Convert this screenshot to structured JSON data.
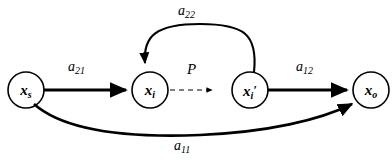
{
  "diagram": {
    "type": "signal-flow-graph",
    "background_color": "#ffffff",
    "stroke_color": "#000000",
    "nodes": [
      {
        "id": "xs",
        "symbol": "x",
        "subscript": "s",
        "prime": "",
        "cx": 26,
        "cy": 90,
        "r": 18
      },
      {
        "id": "xi",
        "symbol": "x",
        "subscript": "i",
        "prime": "",
        "cx": 150,
        "cy": 90,
        "r": 18
      },
      {
        "id": "xiprime",
        "symbol": "x",
        "subscript": "i",
        "prime": "′",
        "cx": 250,
        "cy": 90,
        "r": 18
      },
      {
        "id": "xo",
        "symbol": "x",
        "subscript": "o",
        "prime": "",
        "cx": 371,
        "cy": 90,
        "r": 18
      }
    ],
    "edges": [
      {
        "id": "e_a21",
        "from": "xs",
        "to": "xi",
        "label": "a",
        "sublabel": "21",
        "style": "solid",
        "shape": "straight"
      },
      {
        "id": "e_P",
        "from": "xi",
        "to": "xiprime",
        "label": "P",
        "sublabel": "",
        "style": "dashed",
        "shape": "straight"
      },
      {
        "id": "e_a12",
        "from": "xiprime",
        "to": "xo",
        "label": "a",
        "sublabel": "12",
        "style": "solid",
        "shape": "straight"
      },
      {
        "id": "e_a22",
        "from": "xiprime",
        "to": "xi",
        "label": "a",
        "sublabel": "22",
        "style": "solid",
        "shape": "arc-up"
      },
      {
        "id": "e_a11",
        "from": "xs",
        "to": "xo",
        "label": "a",
        "sublabel": "11",
        "style": "solid",
        "shape": "arc-down"
      }
    ],
    "labels": {
      "a21": {
        "text": "a",
        "sub": "21",
        "x": 68,
        "y": 60
      },
      "a22": {
        "text": "a",
        "sub": "22",
        "x": 178,
        "y": 4
      },
      "a12": {
        "text": "a",
        "sub": "12",
        "x": 296,
        "y": 60
      },
      "a11": {
        "text": "a",
        "sub": "11",
        "x": 174,
        "y": 139
      },
      "P": {
        "text": "P",
        "sub": "",
        "x": 187,
        "y": 62
      }
    }
  }
}
